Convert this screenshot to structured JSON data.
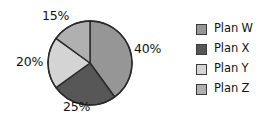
{
  "chart_data": {
    "type": "pie",
    "title": "",
    "subtitle": "",
    "xlabel": "",
    "ylabel": "",
    "grid": false,
    "legend_position": "right",
    "start_angle_deg": 0,
    "direction": "clockwise",
    "categories": [
      "Plan W",
      "Plan X",
      "Plan Y",
      "Plan Z"
    ],
    "values": [
      40,
      25,
      20,
      15
    ],
    "value_unit": "%",
    "data_labels": [
      "40%",
      "25%",
      "20%",
      "15%"
    ],
    "colors": [
      "#969696",
      "#575757",
      "#d4d4d4",
      "#b0b0b0"
    ],
    "slices": [
      {
        "label": "Plan W",
        "value": 40,
        "data_label": "40%",
        "color": "#969696",
        "start_deg": 0,
        "end_deg": 144
      },
      {
        "label": "Plan X",
        "value": 25,
        "data_label": "25%",
        "color": "#575757",
        "start_deg": 144,
        "end_deg": 234
      },
      {
        "label": "Plan Y",
        "value": 20,
        "data_label": "20%",
        "color": "#d4d4d4",
        "start_deg": 234,
        "end_deg": 306
      },
      {
        "label": "Plan Z",
        "value": 15,
        "data_label": "15%",
        "color": "#b0b0b0",
        "start_deg": 306,
        "end_deg": 360
      }
    ]
  },
  "pie": {
    "outline_color": "#2a2a2a",
    "labels": {
      "w": "40%",
      "x": "25%",
      "y": "20%",
      "z": "15%"
    }
  },
  "legend": {
    "items": [
      {
        "label": "Plan W",
        "color": "#969696"
      },
      {
        "label": "Plan X",
        "color": "#575757"
      },
      {
        "label": "Plan Y",
        "color": "#d4d4d4"
      },
      {
        "label": "Plan Z",
        "color": "#b0b0b0"
      }
    ]
  }
}
